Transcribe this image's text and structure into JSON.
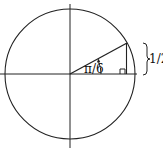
{
  "diagram": {
    "angle_label": "π/6",
    "opposite_label": "1/2",
    "colors": {
      "stroke": "#222222",
      "background": "#ffffff"
    }
  }
}
